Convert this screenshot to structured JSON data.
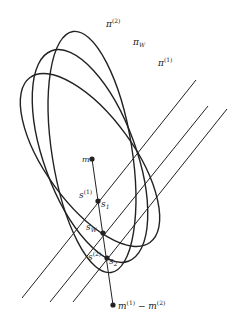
{
  "diagram": {
    "ellipses": [
      {
        "id": "pi2",
        "label": "π",
        "sup": "(2)",
        "cx": 92,
        "cy": 152,
        "rx": 40,
        "ry": 122,
        "rot": -9,
        "label_x": 106,
        "label_y": 27
      },
      {
        "id": "piW",
        "label": "π",
        "sub": "W",
        "cx": 90,
        "cy": 156,
        "rx": 46,
        "ry": 112,
        "rot": -20,
        "label_x": 133,
        "label_y": 45
      },
      {
        "id": "pi1",
        "label": "π",
        "sup": "(1)",
        "cx": 90,
        "cy": 160,
        "rx": 44,
        "ry": 102,
        "rot": -36,
        "label_x": 158,
        "label_y": 66
      }
    ],
    "parallel_lines": [
      {
        "x1": 22,
        "y1": 298,
        "x2": 196,
        "y2": 80
      },
      {
        "x1": 50,
        "y1": 302,
        "x2": 208,
        "y2": 106
      },
      {
        "x1": 73,
        "y1": 302,
        "x2": 227,
        "y2": 109
      }
    ],
    "axis_line": {
      "x1": 92,
      "y1": 159,
      "x2": 113,
      "y2": 305
    },
    "points": [
      {
        "id": "m",
        "x": 92,
        "y": 159,
        "label": "m",
        "label_x": 82,
        "label_y": 162
      },
      {
        "id": "s1",
        "x": 98,
        "y": 201,
        "label": "s",
        "sup": "(1)",
        "label_x": 79,
        "label_y": 198,
        "label2": "s",
        "sub2": "1",
        "label2_x": 101,
        "label2_y": 207
      },
      {
        "id": "sW",
        "x": 103,
        "y": 233,
        "label": "s",
        "sub": "W",
        "label_x": 86,
        "label_y": 230
      },
      {
        "id": "s2",
        "x": 107,
        "y": 258,
        "label": "s",
        "sup": "(2)",
        "label_x": 88,
        "label_y": 260,
        "label2": "s",
        "sub2": "2",
        "label2_x": 109,
        "label2_y": 264
      },
      {
        "id": "mdiff",
        "x": 113,
        "y": 305,
        "label": "m⁽¹⁾ − m⁽²⁾",
        "label_x": 118,
        "label_y": 309
      }
    ],
    "stroke_color": "#222222"
  }
}
